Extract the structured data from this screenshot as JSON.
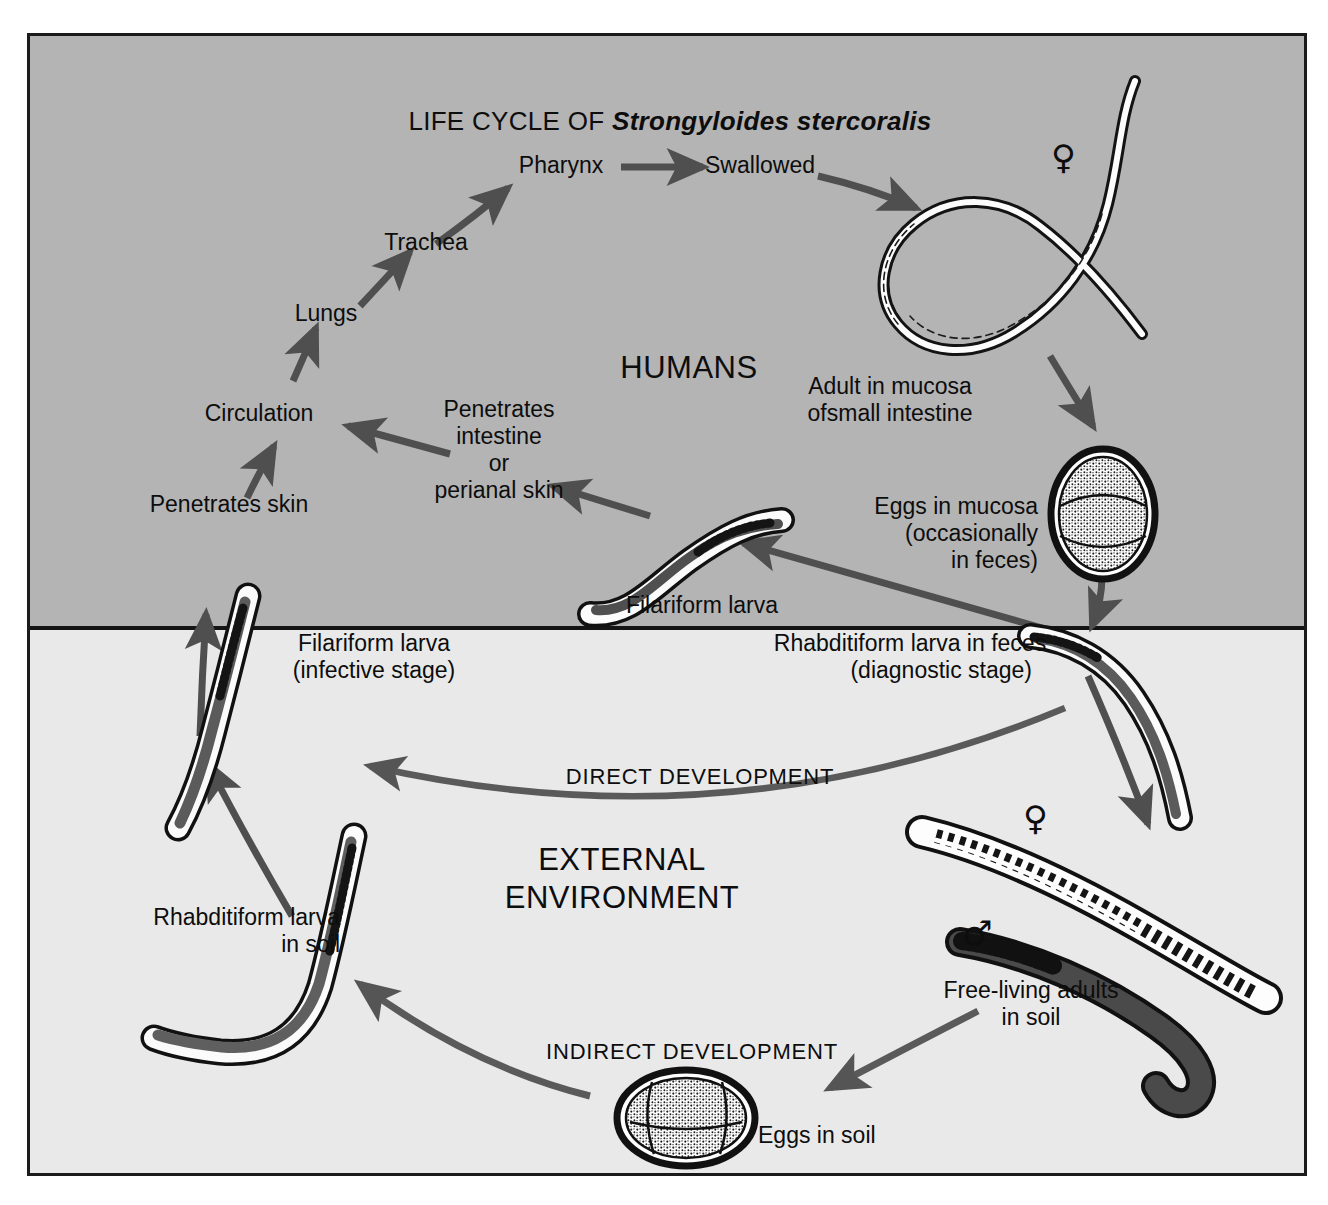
{
  "title": {
    "prefix": "LIFE CYCLE OF ",
    "species": "Strongyloides stercoralis",
    "full": "LIFE CYCLE OF Strongyloides stercoralis"
  },
  "zones": [
    {
      "id": "humans",
      "label": "HUMANS",
      "background": "#b4b4b4"
    },
    {
      "id": "external",
      "label": "EXTERNAL\nENVIRONMENT",
      "background": "#e9e9e9"
    }
  ],
  "zone_labels": {
    "humans": "HUMANS",
    "external_line1": "EXTERNAL",
    "external_line2": "ENVIRONMENT"
  },
  "pathways": {
    "direct": "DIRECT DEVELOPMENT",
    "indirect": "INDIRECT DEVELOPMENT"
  },
  "stages": {
    "pharynx": "Pharynx",
    "swallowed": "Swallowed",
    "trachea": "Trachea",
    "lungs": "Lungs",
    "circulation": "Circulation",
    "penetrates_skin": "Penetrates skin",
    "penetrates_intestine": "Penetrates\nintestine\nor\nperianal skin",
    "penetrates_intestine_l1": "Penetrates",
    "penetrates_intestine_l2": "intestine",
    "penetrates_intestine_l3": "or",
    "penetrates_intestine_l4": "perianal skin",
    "adult_mucosa_l1": "Adult in mucosa",
    "adult_mucosa_l2": "ofsmall intestine",
    "eggs_mucosa_l1": "Eggs in mucosa",
    "eggs_mucosa_l2": "(occasionally",
    "eggs_mucosa_l3": "in feces)",
    "filariform_humans": "Filariform larva",
    "filariform_infective_l1": "Filariform larva",
    "filariform_infective_l2": "(infective stage)",
    "rhabditiform_feces_l1": "Rhabditiform larva in feces",
    "rhabditiform_feces_l2": "(diagnostic stage)",
    "rhabditiform_soil_l1": "Rhabditiform larva",
    "rhabditiform_soil_l2": "in soil",
    "free_living_l1": "Free-living adults",
    "free_living_l2": "in soil",
    "eggs_soil": "Eggs in soil"
  },
  "sex_symbols": {
    "female": "♀",
    "male": "♂"
  },
  "colors": {
    "frame_border": "#1b1b1b",
    "humans_band": "#b4b4b4",
    "external_band": "#e9e9e9",
    "arrow": "#4f4f4f",
    "text": "#0d0d0d",
    "organism_outline": "#111111",
    "organism_dark_fill": "#4a4a4a",
    "organism_light_fill": "#fbfbfb"
  }
}
